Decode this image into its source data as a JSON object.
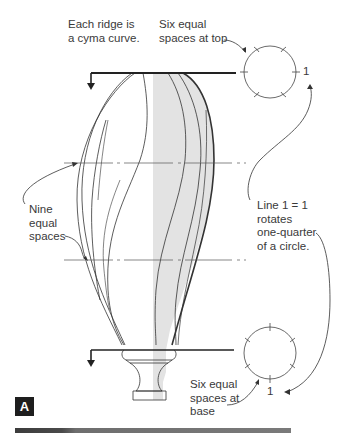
{
  "figure_label": "A",
  "annotations": {
    "ridge_note": "Each ridge is\na cyma curve.",
    "top_spaces": "Six equal\nspaces at top",
    "nine_spaces": "Nine\nequal\nspaces",
    "rotation_note": "Line 1 = 1\nrotates\none-quarter\nof a circle.",
    "base_spaces": "Six equal\nspaces at\nbase",
    "top_circle_marker": "1",
    "base_circle_marker": "1"
  },
  "diagram": {
    "top_circle_divisions": 6,
    "base_circle_divisions": 6,
    "height_divisions": 9,
    "colors": {
      "line": "#333333",
      "shading": "#e3e3e3",
      "badge": "#1e1e1e",
      "text": "#3a3a3a"
    }
  }
}
